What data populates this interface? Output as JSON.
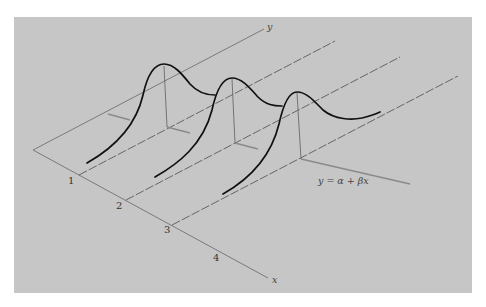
{
  "figure": {
    "background_color": "#c6c6c6",
    "page_color": "#ffffff",
    "axis_color": "#7a7a7a",
    "curve_color": "#111111",
    "guide_color": "#5a5a5a"
  },
  "axes": {
    "x_label": "x",
    "y_label": "y",
    "ticks": [
      {
        "label": "1"
      },
      {
        "label": "2"
      },
      {
        "label": "3"
      },
      {
        "label": "4"
      }
    ]
  },
  "regression_line": {
    "label": "y = α + βx"
  },
  "distributions": [
    {
      "name": "conditional-distribution-1",
      "at_tick": "1"
    },
    {
      "name": "conditional-distribution-2",
      "at_tick": "2"
    },
    {
      "name": "conditional-distribution-3",
      "at_tick": "3"
    }
  ]
}
